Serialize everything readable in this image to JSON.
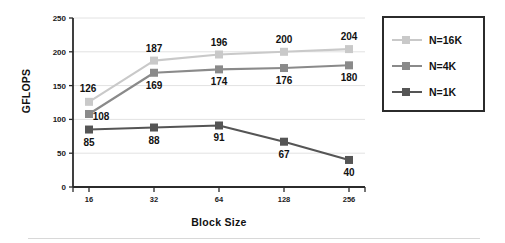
{
  "chart_data": {
    "type": "line",
    "title": "",
    "xlabel": "Block Size",
    "ylabel": "GFLOPS",
    "categories": [
      "16",
      "32",
      "64",
      "128",
      "256"
    ],
    "ylim": [
      0,
      250
    ],
    "yticks": [
      0,
      50,
      100,
      150,
      200,
      250
    ],
    "ytick_labels": [
      "0",
      "50",
      "100",
      "150",
      "200",
      "250"
    ],
    "grid": true,
    "grid_axis": "y",
    "legend_position": "right-outside",
    "series": [
      {
        "name": "N=16K",
        "color": "#c9c9c9",
        "marker": "square",
        "values": [
          126,
          187,
          196,
          200,
          204
        ],
        "labels": [
          "126",
          "187",
          "196",
          "200",
          "204"
        ],
        "label_positions": [
          "above-left",
          "above",
          "above",
          "above",
          "above"
        ]
      },
      {
        "name": "N=4K",
        "color": "#8a8a8a",
        "marker": "square",
        "values": [
          108,
          169,
          174,
          176,
          180
        ],
        "labels": [
          "108",
          "169",
          "174",
          "176",
          "180"
        ],
        "label_positions": [
          "right",
          "below",
          "below",
          "below",
          "below"
        ]
      },
      {
        "name": "N=1K",
        "color": "#555555",
        "marker": "square",
        "values": [
          85,
          88,
          91,
          67,
          40
        ],
        "labels": [
          "85",
          "88",
          "91",
          "67",
          "40"
        ],
        "label_positions": [
          "below",
          "below",
          "below",
          "below",
          "below"
        ]
      }
    ]
  },
  "legend": {
    "entries": [
      {
        "label": "N=16K",
        "color": "#c9c9c9"
      },
      {
        "label": "N=4K",
        "color": "#8a8a8a"
      },
      {
        "label": "N=1K",
        "color": "#555555"
      }
    ]
  },
  "axes": {
    "y_title": "GFLOPS",
    "x_title": "Block Size"
  }
}
